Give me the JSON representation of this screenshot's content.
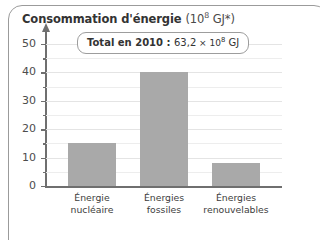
{
  "chart_data": {
    "type": "bar",
    "title_main": "Consommation d'énergie",
    "title_unit_prefix": "(10",
    "title_unit_exponent": "8",
    "title_unit_suffix": " GJ*)",
    "categories": [
      "Énergie nucléaire",
      "Énergies fossiles",
      "Énergies renouvelables"
    ],
    "category_lines": [
      [
        "Énergie",
        "nucléaire"
      ],
      [
        "Énergies",
        "fossiles"
      ],
      [
        "Énergies",
        "renouvelables"
      ]
    ],
    "values": [
      15,
      40,
      8
    ],
    "xlabel": "",
    "ylabel": "",
    "ylim": [
      0,
      52
    ],
    "yticks": [
      0,
      10,
      20,
      30,
      40,
      50
    ],
    "ytick_labels": [
      "0",
      "10",
      "20",
      "30",
      "40",
      "50"
    ],
    "minor_tick_step": 5,
    "grid": true,
    "grid_step": 5,
    "legend": null,
    "bar_color": "#a9a9a9",
    "axis_color": "#6f6f6f",
    "grid_color": "#ededed",
    "annotation": {
      "lead": "Total en 2010 : ",
      "value": "63,2",
      "times": " × 10",
      "exponent": "8",
      "unit": " GJ",
      "full_text": "Total en 2010 : 63,2 × 10^8 GJ"
    }
  }
}
